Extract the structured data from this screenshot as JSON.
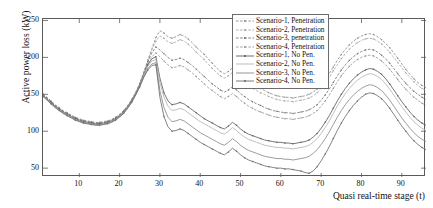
{
  "chart_data": {
    "type": "line",
    "title": "",
    "xlabel": "Quasi real-time stage (t)",
    "ylabel": "Active power loss (kW)",
    "xlim": [
      1,
      96
    ],
    "ylim": [
      38,
      252
    ],
    "xticks": [
      10,
      20,
      30,
      40,
      50,
      60,
      70,
      80,
      90
    ],
    "yticks": [
      50,
      100,
      150,
      200,
      250
    ],
    "grid": false,
    "legend_position": "top-right",
    "x": [
      1,
      2,
      3,
      4,
      5,
      6,
      7,
      8,
      9,
      10,
      11,
      12,
      13,
      14,
      15,
      16,
      17,
      18,
      19,
      20,
      21,
      22,
      23,
      24,
      25,
      26,
      27,
      28,
      29,
      30,
      31,
      32,
      33,
      34,
      35,
      36,
      37,
      38,
      39,
      40,
      41,
      42,
      43,
      44,
      45,
      46,
      47,
      48,
      49,
      50,
      51,
      52,
      53,
      54,
      55,
      56,
      57,
      58,
      59,
      60,
      61,
      62,
      63,
      64,
      65,
      66,
      67,
      68,
      69,
      70,
      71,
      72,
      73,
      74,
      75,
      76,
      77,
      78,
      79,
      80,
      81,
      82,
      83,
      84,
      85,
      86,
      87,
      88,
      89,
      90,
      91,
      92,
      93,
      94,
      95,
      96
    ],
    "series": [
      {
        "name": "Scenario-1, Penetration",
        "color": "#8f8f8f",
        "marker": true,
        "values": [
          151,
          146,
          141,
          136,
          132,
          128,
          125,
          122,
          119,
          117,
          115,
          114,
          113,
          112,
          112,
          113,
          114,
          116,
          119,
          123,
          128,
          135,
          143,
          153,
          165,
          180,
          196,
          212,
          227,
          236,
          233,
          228,
          226,
          228,
          231,
          229,
          225,
          220,
          214,
          209,
          204,
          198,
          192,
          186,
          181,
          178,
          181,
          186,
          182,
          176,
          171,
          167,
          164,
          161,
          158,
          155,
          152,
          150,
          148,
          147,
          146,
          146,
          145,
          146,
          147,
          148,
          150,
          153,
          157,
          163,
          170,
          178,
          187,
          196,
          204,
          211,
          217,
          222,
          226,
          229,
          231,
          232,
          231,
          228,
          224,
          219,
          213,
          206,
          199,
          191,
          184,
          177,
          171,
          166,
          162,
          159
        ]
      },
      {
        "name": "Scenario-2, Penetration",
        "color": "#a8a8a8",
        "marker": true,
        "values": [
          150,
          145,
          140,
          135,
          131,
          127,
          124,
          121,
          118,
          116,
          114,
          113,
          112,
          111,
          111,
          112,
          113,
          115,
          118,
          122,
          127,
          134,
          142,
          152,
          164,
          179,
          195,
          210,
          222,
          229,
          226,
          221,
          219,
          221,
          224,
          222,
          218,
          213,
          207,
          202,
          197,
          191,
          185,
          180,
          175,
          172,
          175,
          180,
          176,
          170,
          165,
          161,
          158,
          155,
          152,
          150,
          147,
          145,
          143,
          142,
          141,
          141,
          140,
          141,
          142,
          143,
          145,
          148,
          152,
          158,
          165,
          173,
          182,
          190,
          198,
          205,
          211,
          216,
          220,
          223,
          225,
          226,
          225,
          222,
          218,
          213,
          207,
          200,
          193,
          186,
          179,
          173,
          167,
          162,
          158,
          155
        ]
      },
      {
        "name": "Scenario-3, penetration",
        "color": "#777777",
        "marker": true,
        "values": [
          150,
          145,
          140,
          135,
          131,
          127,
          124,
          121,
          118,
          116,
          114,
          113,
          112,
          111,
          111,
          112,
          113,
          115,
          118,
          122,
          127,
          134,
          142,
          152,
          164,
          179,
          194,
          206,
          214,
          210,
          205,
          200,
          196,
          197,
          199,
          197,
          193,
          189,
          184,
          179,
          174,
          169,
          164,
          160,
          156,
          153,
          156,
          160,
          156,
          151,
          147,
          143,
          140,
          137,
          135,
          132,
          130,
          128,
          127,
          126,
          125,
          125,
          124,
          125,
          126,
          127,
          129,
          132,
          136,
          142,
          149,
          157,
          166,
          175,
          183,
          190,
          196,
          201,
          205,
          208,
          210,
          211,
          210,
          207,
          203,
          198,
          192,
          185,
          178,
          171,
          165,
          159,
          154,
          150,
          146,
          143
        ]
      },
      {
        "name": "Scenario-4, Penetration",
        "color": "#989898",
        "marker": true,
        "values": [
          149,
          144,
          139,
          134,
          130,
          126,
          123,
          120,
          117,
          115,
          113,
          112,
          111,
          110,
          110,
          111,
          112,
          114,
          117,
          121,
          126,
          133,
          141,
          151,
          163,
          177,
          191,
          201,
          206,
          201,
          195,
          190,
          186,
          187,
          189,
          187,
          183,
          179,
          174,
          169,
          164,
          159,
          155,
          151,
          147,
          144,
          147,
          151,
          147,
          142,
          138,
          134,
          131,
          128,
          126,
          124,
          122,
          120,
          119,
          118,
          117,
          117,
          116,
          117,
          118,
          119,
          121,
          124,
          128,
          134,
          141,
          149,
          158,
          167,
          175,
          182,
          188,
          193,
          197,
          200,
          202,
          203,
          202,
          199,
          195,
          190,
          184,
          177,
          170,
          163,
          157,
          151,
          146,
          142,
          138,
          135
        ]
      },
      {
        "name": "Scenario-1, No Pen.",
        "color": "#5e5e5e",
        "marker": true,
        "values": [
          149,
          144,
          139,
          134,
          130,
          126,
          123,
          120,
          117,
          115,
          113,
          112,
          111,
          110,
          110,
          111,
          112,
          114,
          117,
          121,
          126,
          133,
          141,
          151,
          163,
          177,
          190,
          198,
          201,
          172,
          152,
          141,
          136,
          137,
          139,
          137,
          133,
          129,
          125,
          121,
          117,
          114,
          111,
          108,
          105,
          103,
          107,
          112,
          108,
          103,
          99,
          96,
          94,
          92,
          90,
          88,
          87,
          86,
          85,
          85,
          84,
          84,
          83,
          84,
          85,
          86,
          88,
          92,
          97,
          104,
          112,
          121,
          131,
          141,
          150,
          158,
          165,
          171,
          176,
          180,
          183,
          185,
          184,
          181,
          177,
          171,
          164,
          156,
          148,
          140,
          133,
          126,
          120,
          115,
          111,
          108
        ]
      },
      {
        "name": "Scenario-2, No Pen.",
        "color": "#b5b5b5",
        "marker": false,
        "values": [
          148,
          143,
          138,
          133,
          129,
          125,
          122,
          119,
          116,
          114,
          112,
          111,
          110,
          109,
          109,
          110,
          111,
          113,
          116,
          120,
          125,
          132,
          140,
          150,
          162,
          176,
          188,
          195,
          197,
          166,
          146,
          134,
          128,
          129,
          131,
          129,
          125,
          121,
          117,
          113,
          110,
          107,
          104,
          101,
          98,
          96,
          100,
          105,
          101,
          96,
          92,
          89,
          87,
          85,
          83,
          81,
          80,
          79,
          78,
          78,
          77,
          77,
          76,
          77,
          78,
          79,
          81,
          85,
          90,
          97,
          105,
          114,
          124,
          134,
          143,
          151,
          158,
          164,
          169,
          173,
          176,
          178,
          177,
          174,
          170,
          164,
          157,
          149,
          141,
          133,
          126,
          119,
          113,
          108,
          104,
          101
        ]
      },
      {
        "name": "Scenario-3, No Pen.",
        "color": "#8a8a8a",
        "marker": false,
        "values": [
          148,
          143,
          138,
          133,
          129,
          125,
          122,
          119,
          116,
          114,
          112,
          111,
          110,
          109,
          109,
          110,
          111,
          113,
          116,
          120,
          125,
          132,
          140,
          150,
          161,
          174,
          185,
          191,
          193,
          155,
          132,
          119,
          113,
          114,
          116,
          114,
          110,
          106,
          102,
          98,
          95,
          92,
          89,
          86,
          83,
          81,
          85,
          90,
          86,
          81,
          77,
          74,
          72,
          70,
          68,
          66,
          65,
          64,
          63,
          63,
          62,
          62,
          61,
          62,
          63,
          64,
          66,
          70,
          75,
          82,
          90,
          99,
          109,
          119,
          128,
          136,
          143,
          149,
          154,
          158,
          161,
          163,
          162,
          159,
          155,
          149,
          142,
          134,
          126,
          118,
          111,
          104,
          98,
          93,
          89,
          86
        ]
      },
      {
        "name": "Scenario-4, No Pen.",
        "color": "#6d6d6d",
        "marker": true,
        "values": [
          147,
          142,
          137,
          132,
          128,
          124,
          121,
          118,
          115,
          113,
          111,
          110,
          109,
          108,
          108,
          109,
          110,
          112,
          115,
          119,
          124,
          131,
          139,
          149,
          160,
          173,
          183,
          189,
          190,
          146,
          120,
          106,
          100,
          101,
          103,
          101,
          97,
          93,
          89,
          85,
          82,
          79,
          76,
          73,
          70,
          68,
          72,
          77,
          73,
          68,
          64,
          61,
          59,
          57,
          55,
          53,
          52,
          51,
          50,
          50,
          49,
          49,
          48,
          47,
          46,
          44,
          43,
          46,
          52,
          60,
          69,
          79,
          90,
          101,
          111,
          120,
          128,
          135,
          141,
          146,
          150,
          152,
          151,
          148,
          144,
          138,
          131,
          123,
          115,
          107,
          100,
          93,
          87,
          82,
          78,
          75
        ]
      }
    ]
  },
  "legend": {
    "items": [
      "Scenario-1, Penetration",
      "Scenario-2, Penetration",
      "Scenario-3, penetration",
      "Scenario-4, Penetration",
      "Scenario-1, No Pen.",
      "Scenario-2, No Pen.",
      "Scenario-3, No Pen.",
      "Scenario-4, No Pen."
    ]
  }
}
